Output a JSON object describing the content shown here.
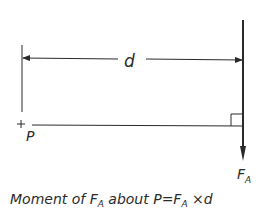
{
  "diagram": {
    "dimension_label": "d",
    "point_label": "P",
    "force_label_main": "F",
    "force_label_sub": "A",
    "caption": {
      "part1": "Moment of ",
      "f1": "F",
      "f1_sub": "A",
      "part2": " about P=",
      "f2": "F",
      "f2_sub": "A",
      "part3": " ×d"
    },
    "colors": {
      "line": "#2a2a2a",
      "background": "#ffffff"
    }
  }
}
